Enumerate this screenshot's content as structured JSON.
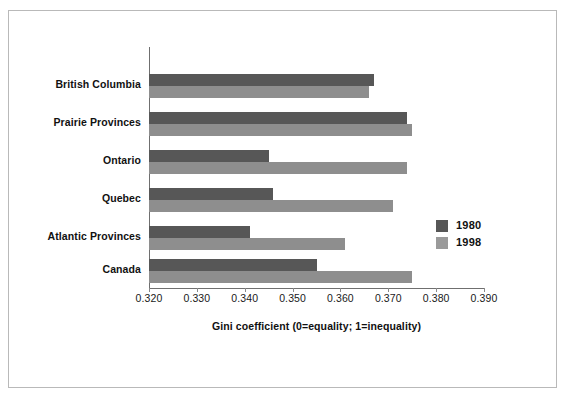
{
  "chart_data": {
    "type": "bar",
    "orientation": "horizontal",
    "title": "",
    "xlabel": "Gini coefficient (0=equality; 1=inequality)",
    "ylabel": "",
    "categories": [
      "British Columbia",
      "Prairie Provinces",
      "Ontario",
      "Quebec",
      "Atlantic Provinces",
      "Canada"
    ],
    "series": [
      {
        "name": "1980",
        "color": "#575757",
        "values": [
          0.367,
          0.374,
          0.345,
          0.346,
          0.341,
          0.355
        ]
      },
      {
        "name": "1998",
        "color": "#8e8e8e",
        "values": [
          0.366,
          0.375,
          0.374,
          0.371,
          0.361,
          0.375
        ]
      }
    ],
    "xlim": [
      0.32,
      0.39
    ],
    "xticks": [
      "0.320",
      "0.330",
      "0.340",
      "0.350",
      "0.360",
      "0.370",
      "0.380",
      "0.390"
    ],
    "xtick_values": [
      0.32,
      0.33,
      0.34,
      0.35,
      0.36,
      0.37,
      0.38,
      0.39
    ],
    "grid": false,
    "legend_position": "right-middle",
    "legend_entries": [
      "1980",
      "1998"
    ]
  }
}
